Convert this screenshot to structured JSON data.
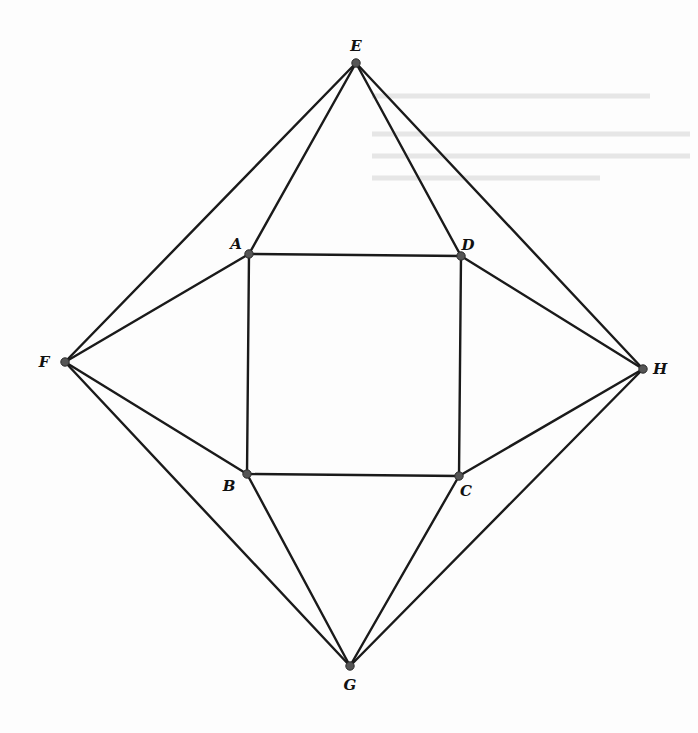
{
  "diagram": {
    "type": "geometry",
    "points": [
      {
        "name": "A",
        "x": 249,
        "y": 254,
        "lx": 236,
        "ly": 249
      },
      {
        "name": "B",
        "x": 247,
        "y": 474,
        "lx": 229,
        "ly": 491
      },
      {
        "name": "C",
        "x": 459,
        "y": 476,
        "lx": 466,
        "ly": 496
      },
      {
        "name": "D",
        "x": 461,
        "y": 256,
        "lx": 468,
        "ly": 250
      },
      {
        "name": "E",
        "x": 356,
        "y": 63,
        "lx": 356,
        "ly": 51
      },
      {
        "name": "F",
        "x": 65,
        "y": 362,
        "lx": 44,
        "ly": 367
      },
      {
        "name": "G",
        "x": 350,
        "y": 666,
        "lx": 350,
        "ly": 690
      },
      {
        "name": "H",
        "x": 643,
        "y": 369,
        "lx": 660,
        "ly": 374
      }
    ],
    "edges": [
      [
        "A",
        "D"
      ],
      [
        "D",
        "C"
      ],
      [
        "C",
        "B"
      ],
      [
        "B",
        "A"
      ],
      [
        "E",
        "A"
      ],
      [
        "E",
        "D"
      ],
      [
        "E",
        "F"
      ],
      [
        "E",
        "H"
      ],
      [
        "F",
        "A"
      ],
      [
        "F",
        "B"
      ],
      [
        "F",
        "G"
      ],
      [
        "H",
        "D"
      ],
      [
        "H",
        "C"
      ],
      [
        "H",
        "G"
      ],
      [
        "G",
        "B"
      ],
      [
        "G",
        "C"
      ]
    ]
  }
}
